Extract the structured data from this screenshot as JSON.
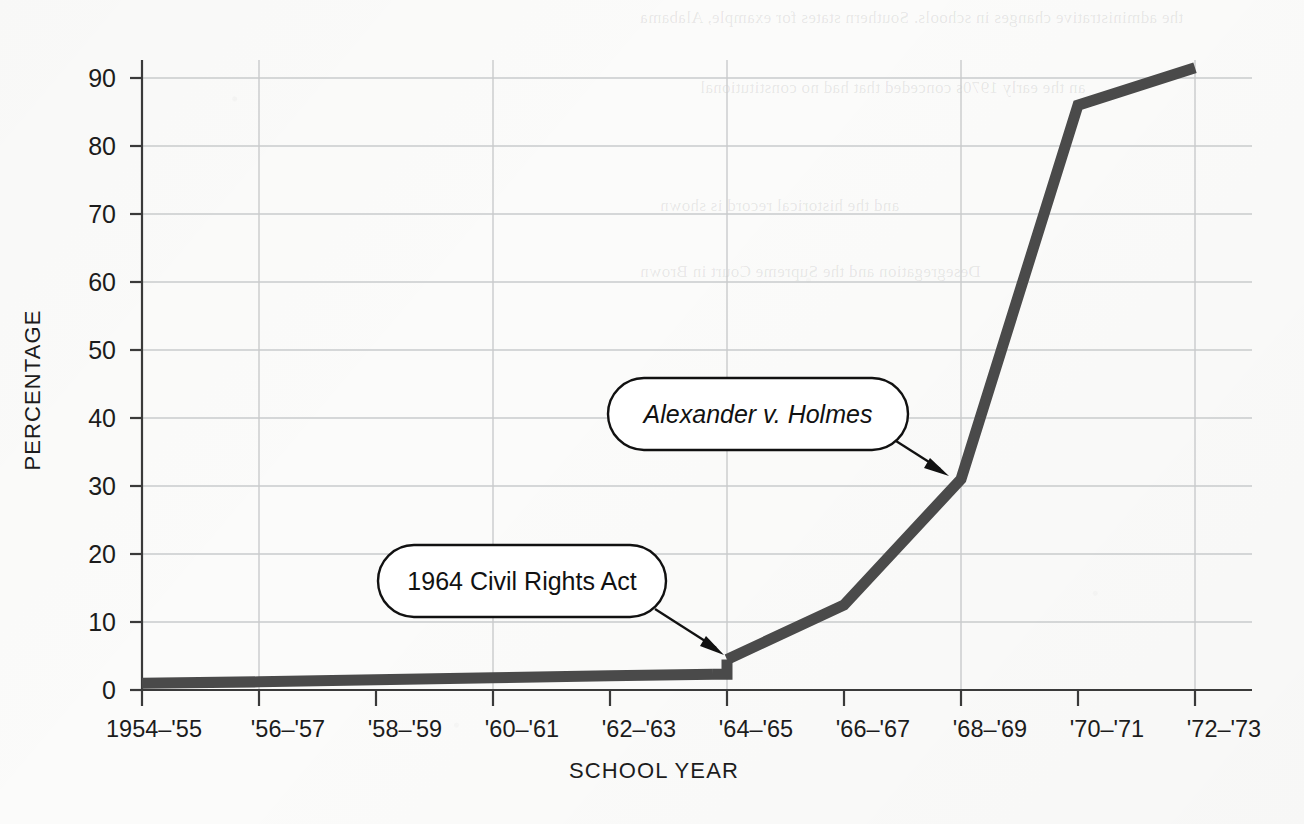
{
  "figure": {
    "background_color": "#fbfbfa",
    "line_color": "#4a4a4a",
    "grid_color": "#c9cbcc",
    "axis_color": "#3a3a3a"
  },
  "axes": {
    "y_title": "PERCENTAGE",
    "x_title": "SCHOOL  YEAR",
    "y_ticks": [
      "0",
      "10",
      "20",
      "30",
      "40",
      "50",
      "60",
      "70",
      "80",
      "90"
    ],
    "x_ticks": [
      "1954–'55",
      "'56–'57",
      "'58–'59",
      "'60–'61",
      "'62–'63",
      "'64–'65",
      "'66–'67",
      "'68–'69",
      "'70–'71",
      "'72–'73"
    ]
  },
  "annotations": [
    {
      "id": "civil-rights-act",
      "label": "1964 Civil Rights Act",
      "italic": false
    },
    {
      "id": "alexander-v-holmes",
      "label": "Alexander v. Holmes",
      "italic": true
    }
  ],
  "ghost_text": [
    "the administrative changes in schools. Southern states for example, Alabama",
    "an the early 1970s conceded that had no constitutional",
    "and the historical record is shown",
    "Desegregation and the Supreme Court in Brown"
  ],
  "chart_data": {
    "type": "line",
    "title": "",
    "xlabel": "SCHOOL  YEAR",
    "ylabel": "PERCENTAGE",
    "xlim": [
      "1954–'55",
      "'72–'73"
    ],
    "ylim": [
      0,
      93
    ],
    "grid": true,
    "legend": "none",
    "categories": [
      "1954–'55",
      "'56–'57",
      "'58–'59",
      "'60–'61",
      "'62–'63",
      "'64–'65",
      "'66–'67",
      "'68–'69",
      "'70–'71",
      "'72–'73"
    ],
    "series": [
      {
        "name": "Percentage of Black students in desegregated schools",
        "values": [
          1.0,
          1.2,
          1.5,
          1.8,
          2.1,
          4.5,
          12.5,
          31.0,
          86.0,
          91.5
        ]
      }
    ],
    "notes": [
      {
        "at_category": "'64–'65",
        "at_value": 4.5,
        "text": "1964 Civil Rights Act"
      },
      {
        "at_category": "'68–'69",
        "at_value": 31.0,
        "text": "Alexander v. Holmes"
      }
    ]
  }
}
